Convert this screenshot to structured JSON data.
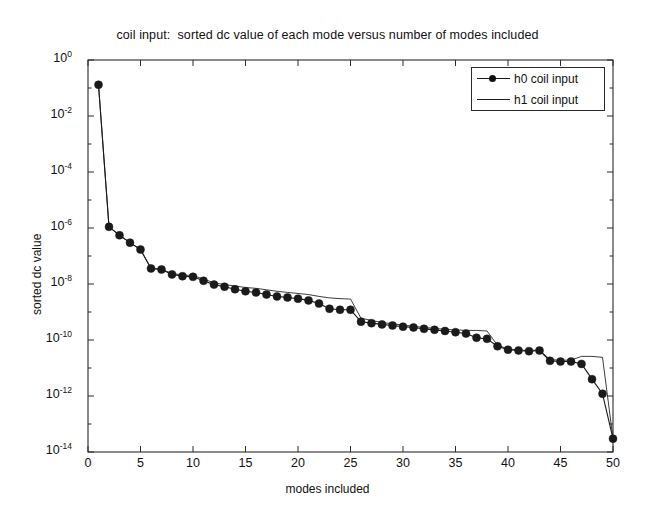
{
  "figure": {
    "background_color": "#ffffff",
    "axes_color": "#2a2a2a",
    "series_color": "#1a1a1a"
  },
  "legend": {
    "position": "top-right",
    "entries": [
      {
        "label": "h0 coil input",
        "style": "line-with-filled-circle-markers"
      },
      {
        "label": "h1 coil input",
        "style": "plain-thin-line"
      }
    ]
  },
  "chart_data": {
    "type": "line",
    "title": "coil input:  sorted dc value of each mode versus number of modes included",
    "xlabel": "modes included",
    "ylabel": "sorted dc value",
    "yscale": "log",
    "xscale": "linear",
    "xlim": [
      0,
      50
    ],
    "ylim": [
      1e-14,
      1
    ],
    "grid": false,
    "xticks": [
      0,
      5,
      10,
      15,
      20,
      25,
      30,
      35,
      40,
      45,
      50
    ],
    "xtick_labels": [
      "0",
      "5",
      "10",
      "15",
      "20",
      "25",
      "30",
      "35",
      "40",
      "45",
      "50"
    ],
    "yticks": [
      1,
      0.01,
      0.0001,
      1e-06,
      1e-08,
      1e-10,
      1e-12,
      1e-14
    ],
    "ytick_labels": [
      "10^0",
      "10^-2",
      "10^-4",
      "10^-6",
      "10^-8",
      "10^-10",
      "10^-12",
      "10^-14"
    ],
    "x": [
      1,
      2,
      3,
      4,
      5,
      6,
      7,
      8,
      9,
      10,
      11,
      12,
      13,
      14,
      15,
      16,
      17,
      18,
      19,
      20,
      21,
      22,
      23,
      24,
      25,
      26,
      27,
      28,
      29,
      30,
      31,
      32,
      33,
      34,
      35,
      36,
      37,
      38,
      39,
      40,
      41,
      42,
      43,
      44,
      45,
      46,
      47,
      48,
      49,
      50
    ],
    "series": [
      {
        "name": "h0 coil input",
        "marker": "filled-circle",
        "values": [
          0.13,
          1.1e-06,
          5.5e-07,
          3e-07,
          1.7e-07,
          3.6e-08,
          3.3e-08,
          2.2e-08,
          1.9e-08,
          1.8e-08,
          1.3e-08,
          9.5e-09,
          8e-09,
          6.5e-09,
          5.5e-09,
          5e-09,
          4.2e-09,
          3.6e-09,
          3.3e-09,
          3e-09,
          2.6e-09,
          2e-09,
          1.3e-09,
          1.2e-09,
          1.2e-09,
          4.5e-10,
          4e-10,
          3.6e-10,
          3.3e-10,
          3e-10,
          2.8e-10,
          2.5e-10,
          2.3e-10,
          2.1e-10,
          1.9e-10,
          1.7e-10,
          1.2e-10,
          1.1e-10,
          6e-11,
          4.5e-11,
          4.2e-11,
          4e-11,
          4.2e-11,
          1.8e-11,
          1.7e-11,
          1.7e-11,
          1.4e-11,
          4e-12,
          1.2e-12,
          3e-14
        ]
      },
      {
        "name": "h1 coil input",
        "marker": "none",
        "values": [
          0.13,
          1.1e-06,
          5.5e-07,
          3e-07,
          1.7e-07,
          3.6e-08,
          3.3e-08,
          2.4e-08,
          2.1e-08,
          2e-08,
          1.5e-08,
          1.1e-08,
          9.5e-09,
          8.5e-09,
          7.5e-09,
          7e-09,
          6.2e-09,
          5.5e-09,
          5e-09,
          4.6e-09,
          4.2e-09,
          3.6e-09,
          3.2e-09,
          3e-09,
          2.9e-09,
          6e-10,
          5e-10,
          4.2e-10,
          3.8e-10,
          3.4e-10,
          3.1e-10,
          2.8e-10,
          2.6e-10,
          2.4e-10,
          2.3e-10,
          2.2e-10,
          2.2e-10,
          2.1e-10,
          6.5e-11,
          4.8e-11,
          4.4e-11,
          4.2e-11,
          4.4e-11,
          2e-11,
          1.9e-11,
          1.9e-11,
          2.6e-11,
          2.6e-11,
          2.4e-11,
          3e-14
        ]
      }
    ]
  }
}
